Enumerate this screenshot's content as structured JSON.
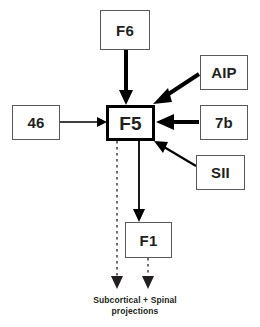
{
  "diagram": {
    "canvas": {
      "width": 260,
      "height": 327,
      "background": "#ffffff"
    },
    "colors": {
      "box_stroke": "#58595b",
      "emphasis_stroke": "#000000",
      "arrow_solid": "#000000",
      "arrow_dotted": "#6d6e71",
      "text": "#231f20"
    },
    "nodes": [
      {
        "id": "F6",
        "label": "F6",
        "x": 100,
        "y": 10,
        "w": 50,
        "h": 40,
        "emphasis": false
      },
      {
        "id": "AIP",
        "label": "AIP",
        "x": 200,
        "y": 55,
        "w": 48,
        "h": 35,
        "emphasis": false
      },
      {
        "id": "46",
        "label": "46",
        "x": 12,
        "y": 105,
        "w": 48,
        "h": 35,
        "emphasis": false
      },
      {
        "id": "F5",
        "label": "F5",
        "x": 106,
        "y": 105,
        "w": 49,
        "h": 36,
        "emphasis": true
      },
      {
        "id": "7b",
        "label": "7b",
        "x": 200,
        "y": 105,
        "w": 48,
        "h": 35,
        "emphasis": false
      },
      {
        "id": "SII",
        "label": "SII",
        "x": 196,
        "y": 155,
        "w": 49,
        "h": 35,
        "emphasis": false
      },
      {
        "id": "F1",
        "label": "F1",
        "x": 125,
        "y": 222,
        "w": 47,
        "h": 36,
        "emphasis": false
      }
    ],
    "edges": [
      {
        "id": "F6-F5",
        "from": "F6",
        "to": "F5",
        "style": "solid",
        "weight": "thick"
      },
      {
        "id": "AIP-F5",
        "from": "AIP",
        "to": "F5",
        "style": "solid",
        "weight": "thick"
      },
      {
        "id": "7b-F5",
        "from": "7b",
        "to": "F5",
        "style": "solid",
        "weight": "thick"
      },
      {
        "id": "SII-F5",
        "from": "SII",
        "to": "F5",
        "style": "solid",
        "weight": "thin"
      },
      {
        "id": "46-F5",
        "from": "46",
        "to": "F5",
        "style": "solid",
        "weight": "thin"
      },
      {
        "id": "F5-F1",
        "from": "F5",
        "to": "F1",
        "style": "solid",
        "weight": "thin"
      },
      {
        "id": "F5-proj",
        "from": "F5",
        "to": "projections",
        "style": "dotted",
        "weight": "thin"
      },
      {
        "id": "F1-proj",
        "from": "F1",
        "to": "projections",
        "style": "dotted",
        "weight": "thin"
      }
    ],
    "caption": {
      "line1": "Subcortical + Spinal",
      "line2": "projections"
    }
  }
}
